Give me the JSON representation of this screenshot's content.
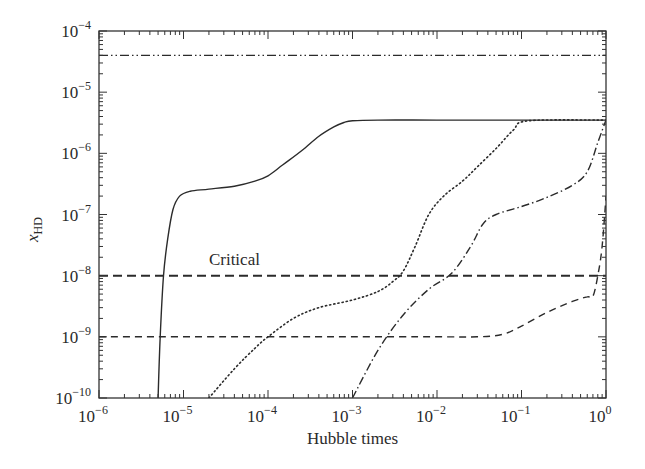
{
  "chart_data": {
    "type": "line",
    "title": "",
    "xlabel": "Hubble times",
    "ylabel": "x_HD",
    "ylabel_display": {
      "base": "x",
      "sub": "HD"
    },
    "xscale": "log",
    "yscale": "log",
    "xlim": [
      1e-06,
      1
    ],
    "ylim": [
      1e-10,
      0.0001
    ],
    "grid": false,
    "legend": "none",
    "x_ticks": [
      {
        "base": "10",
        "exp": "−6",
        "value": 1e-06
      },
      {
        "base": "10",
        "exp": "−5",
        "value": 1e-05
      },
      {
        "base": "10",
        "exp": "−4",
        "value": 0.0001
      },
      {
        "base": "10",
        "exp": "−3",
        "value": 0.001
      },
      {
        "base": "10",
        "exp": "−2",
        "value": 0.01
      },
      {
        "base": "10",
        "exp": "−1",
        "value": 0.1
      },
      {
        "base": "10",
        "exp": "0",
        "value": 1
      }
    ],
    "y_ticks": [
      {
        "base": "10",
        "exp": "−4",
        "value": 0.0001
      },
      {
        "base": "10",
        "exp": "−5",
        "value": 1e-05
      },
      {
        "base": "10",
        "exp": "−6",
        "value": 1e-06
      },
      {
        "base": "10",
        "exp": "−7",
        "value": 1e-07
      },
      {
        "base": "10",
        "exp": "−8",
        "value": 1e-08
      },
      {
        "base": "10",
        "exp": "−9",
        "value": 1e-09
      },
      {
        "base": "10",
        "exp": "−10",
        "value": 1e-10
      }
    ],
    "annotations": [
      {
        "text": "Critical",
        "x": 2e-05,
        "y": 1.5e-08
      }
    ],
    "series": [
      {
        "name": "solid",
        "style": "solid",
        "x": [
          5e-06,
          5.3e-06,
          5.8e-06,
          6.5e-06,
          7.5e-06,
          9e-06,
          1.2e-05,
          2e-05,
          4e-05,
          7e-05,
          0.0001,
          0.00015,
          0.00025,
          0.0004,
          0.0006,
          0.0008,
          0.001,
          0.002,
          0.01,
          0.1,
          1
        ],
        "y": [
          1e-10,
          1e-09,
          1e-08,
          4e-08,
          1.2e-07,
          2e-07,
          2.4e-07,
          2.6e-07,
          2.9e-07,
          3.5e-07,
          4.3e-07,
          6.5e-07,
          1.1e-06,
          1.9e-06,
          2.7e-06,
          3.2e-06,
          3.4e-06,
          3.5e-06,
          3.5e-06,
          3.5e-06,
          3.5e-06
        ]
      },
      {
        "name": "dotted",
        "style": "dotted",
        "x": [
          2e-05,
          4e-05,
          7e-05,
          0.0001,
          0.0002,
          0.0004,
          0.001,
          0.002,
          0.003,
          0.004,
          0.0055,
          0.008,
          0.012,
          0.02,
          0.03,
          0.05,
          0.08,
          0.12,
          1
        ],
        "y": [
          1e-10,
          3e-10,
          6.5e-10,
          1e-09,
          2e-09,
          3e-09,
          4e-09,
          5.5e-09,
          8e-09,
          1.2e-08,
          3e-08,
          1e-07,
          2e-07,
          3.5e-07,
          6e-07,
          1.2e-06,
          2.4e-06,
          3.4e-06,
          3.5e-06
        ]
      },
      {
        "name": "dash-dot",
        "style": "dashdot",
        "x": [
          0.001,
          0.002,
          0.004,
          0.008,
          0.015,
          0.025,
          0.035,
          0.05,
          0.1,
          0.2,
          0.4,
          0.6,
          0.8,
          1
        ],
        "y": [
          1e-10,
          6e-10,
          2.3e-09,
          6e-09,
          1.1e-08,
          3e-08,
          7e-08,
          1e-07,
          1.35e-07,
          1.9e-07,
          3e-07,
          5e-07,
          1.5e-06,
          3.5e-06
        ]
      },
      {
        "name": "dashed-thin",
        "style": "dashed",
        "x": [
          1e-06,
          0.0001,
          0.001,
          0.01,
          0.03,
          0.06,
          0.1,
          0.2,
          0.4,
          0.6,
          0.7,
          0.8,
          0.9,
          1
        ],
        "y": [
          1e-09,
          1e-09,
          1e-09,
          1e-09,
          1e-09,
          1.1e-09,
          1.5e-09,
          2.5e-09,
          3.8e-09,
          4.5e-09,
          4.6e-09,
          1e-08,
          3e-08,
          2e-07
        ]
      },
      {
        "name": "Critical",
        "style": "dashed-thick",
        "x": [
          1e-06,
          1
        ],
        "y": [
          1e-08,
          1e-08
        ]
      },
      {
        "name": "dash-dot-dot",
        "style": "dashdotdot",
        "x": [
          1e-06,
          1
        ],
        "y": [
          4e-05,
          4e-05
        ]
      }
    ]
  },
  "plot_area": {
    "left": 99,
    "top": 31,
    "right": 606,
    "bottom": 398
  }
}
